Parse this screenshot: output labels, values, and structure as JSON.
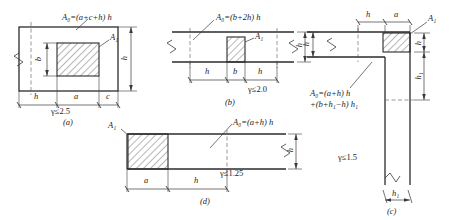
{
  "figure": {
    "colors": {
      "line": "#3a3a3a",
      "thick_line": "#2b2b2b",
      "hatch": "#4a4a4a",
      "dash": "#555555",
      "background": "#ffffff"
    }
  },
  "diagrams": [
    {
      "id": "a",
      "caption": "(a)",
      "formula_head": "A",
      "formula_sub": "0",
      "formula_body": "=(a+c+h) h",
      "area_label": "A",
      "area_label_sub": "1",
      "gamma": "γ≤2.5",
      "dims_horizontal": [
        "h",
        "a",
        "c"
      ],
      "dims_vertical": [
        "b",
        "h"
      ]
    },
    {
      "id": "b",
      "caption": "(b)",
      "formula_head": "A",
      "formula_sub": "0",
      "formula_body": "=(b+2h) h",
      "area_label": "A",
      "area_label_sub": "1",
      "gamma": "γ≤2.0",
      "dims_horizontal": [
        "h",
        "b",
        "h"
      ],
      "dims_vertical": [
        "h"
      ]
    },
    {
      "id": "c",
      "caption": "(c)",
      "formula_line1": "A",
      "formula_line1_sub": "0",
      "formula_line1_body": "=(a+h) h",
      "formula_line2": "+(b+h",
      "formula_line2_sub": "1",
      "formula_line2_body": "−h) h",
      "formula_line2_sub2": "1",
      "area_label": "A",
      "area_label_sub": "1",
      "gamma": "γ≤1.5",
      "dims_horizontal": [
        "h",
        "a"
      ],
      "dims_vertical": [
        "h",
        "h",
        "h"
      ],
      "dim_bottom": "h",
      "dim_bottom_sub": "1"
    },
    {
      "id": "d",
      "caption": "(d)",
      "formula_head": "A",
      "formula_sub": "0",
      "formula_body": "=(a+h) h",
      "area_label": "A",
      "area_label_sub": "1",
      "gamma": "γ≤1.25",
      "dims_horizontal": [
        "a",
        "h"
      ],
      "dims_vertical": [
        "h"
      ]
    }
  ],
  "labels": {
    "a_formula": "A₀=(a+c+h) h",
    "b_formula": "A₀=(b+2h) h",
    "c_formula_1": "A₀=(a+h) h",
    "c_formula_2": "+(b+h₁−h) h₁",
    "d_formula": "A₀=(a+h) h",
    "gamma_a": "γ≤2.5",
    "gamma_b": "γ≤2.0",
    "gamma_c": "γ≤1.5",
    "gamma_d": "γ≤1.25",
    "caption_a": "(a)",
    "caption_b": "(b)",
    "caption_c": "(c)",
    "caption_d": "(d)",
    "h": "h",
    "b": "b",
    "a": "a",
    "c": "c",
    "h1": "h₁",
    "A1": "A₁"
  }
}
